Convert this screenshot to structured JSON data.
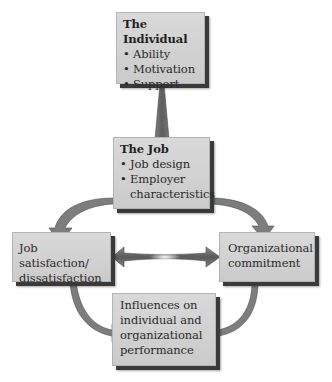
{
  "diagram": {
    "nodes": [
      {
        "id": "individual",
        "title": "The Individual",
        "bullets": [
          "Ability",
          "Motivation",
          "Support"
        ]
      },
      {
        "id": "job",
        "title": "The Job",
        "bullets": [
          "Job design",
          "Employer characteristics"
        ]
      },
      {
        "id": "satisfaction",
        "lines": [
          "Job satisfaction/",
          "dissatisfaction"
        ]
      },
      {
        "id": "commitment",
        "lines": [
          "Organizational",
          "commitment"
        ]
      },
      {
        "id": "influences",
        "lines": [
          "Influences on",
          "individual and",
          "organizational",
          "performance"
        ]
      }
    ],
    "edges": [
      {
        "from": "individual",
        "to": "job",
        "style": "straight-down"
      },
      {
        "from": "job",
        "to": "satisfaction",
        "style": "curved"
      },
      {
        "from": "job",
        "to": "commitment",
        "style": "curved"
      },
      {
        "from": "satisfaction",
        "to": "commitment",
        "style": "double-headed"
      },
      {
        "from": "satisfaction",
        "to": "influences",
        "style": "curved"
      },
      {
        "from": "commitment",
        "to": "influences",
        "style": "curved"
      }
    ],
    "colors": {
      "box_fill": "#d4d4d4",
      "box_shadow": "#3a3a3a",
      "arrow_fill": "#7a7a7a",
      "arrow_dark": "#555555",
      "text": "#2a2a2a"
    }
  }
}
